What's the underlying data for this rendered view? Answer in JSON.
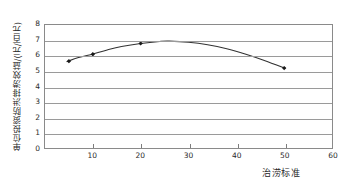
{
  "chart_data": {
    "type": "line",
    "title": "",
    "subtitle": "",
    "xlabel": "治涝标准",
    "ylabel": "单位投资防洪排涝效益/(元/百元)",
    "xlim": [
      0,
      60
    ],
    "ylim": [
      0,
      8
    ],
    "xticks": [
      10,
      20,
      30,
      40,
      50,
      60
    ],
    "yticks": [
      0,
      1,
      2,
      3,
      4,
      5,
      6,
      7,
      8
    ],
    "grid": "horizontal",
    "legend": "none",
    "marker": "filled-diamond",
    "line_color": "#333333",
    "marker_color": "#1a1a1a",
    "grid_color": "#9a9a9a",
    "frame_color": "#8a8a8a",
    "series": [
      {
        "name": "单位投资防洪排涝效益",
        "x": [
          5,
          10,
          20,
          50
        ],
        "values": [
          5.65,
          6.1,
          6.8,
          5.2
        ]
      }
    ],
    "fitted_curve_note": "smooth concave curve peaking near x=26, y=6.95",
    "curve_points": {
      "x": [
        4.6,
        7,
        10,
        13,
        16,
        20,
        24,
        26,
        30,
        34,
        38,
        42,
        46,
        50.2
      ],
      "y": [
        5.62,
        5.88,
        6.12,
        6.38,
        6.6,
        6.8,
        6.93,
        6.95,
        6.88,
        6.72,
        6.46,
        6.1,
        5.68,
        5.18
      ]
    }
  }
}
